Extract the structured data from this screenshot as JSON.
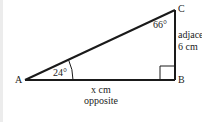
{
  "diagram": {
    "type": "right-triangle",
    "vertices": {
      "A": "A",
      "B": "B",
      "C": "C"
    },
    "angles": {
      "A": "24°",
      "C": "66°",
      "B": "right-angle"
    },
    "sides": {
      "AB": {
        "length": "x cm",
        "role": "opposite"
      },
      "BC": {
        "length": "6 cm",
        "role": "adjace"
      }
    },
    "colors": {
      "stroke": "#1a1a1a",
      "text": "#222222",
      "background": "#ffffff",
      "edge_strip": "#ececec"
    }
  }
}
